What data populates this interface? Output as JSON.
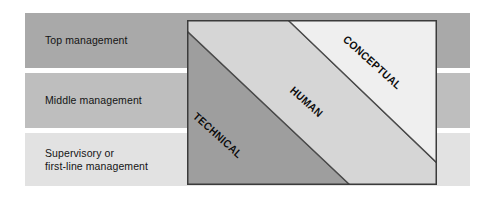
{
  "figure": {
    "width": 495,
    "height": 207,
    "background_color": "#ffffff"
  },
  "levels": [
    {
      "id": "top-management",
      "label": "Top management",
      "band_color": "#a9a9a9"
    },
    {
      "id": "middle-management",
      "label": "Middle management",
      "band_color": "#bebebe"
    },
    {
      "id": "supervisory-management",
      "label": "Supervisory or\nfirst-line management",
      "band_color": "#e2e2e2"
    }
  ],
  "skills_box": {
    "border_color": "#3b3b3b",
    "regions": [
      {
        "id": "technical",
        "label": "TECHNICAL",
        "fill_color": "#9e9e9e",
        "position": "lower-left"
      },
      {
        "id": "human",
        "label": "HUMAN",
        "fill_color": "#d6d6d6",
        "position": "middle-diagonal"
      },
      {
        "id": "conceptual",
        "label": "CONCEPTUAL",
        "fill_color": "#efefef",
        "position": "upper-right"
      }
    ]
  }
}
